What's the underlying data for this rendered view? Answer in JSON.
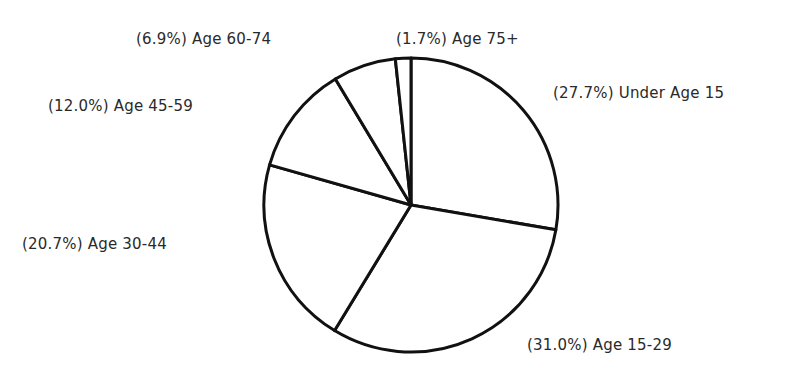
{
  "chart_data": {
    "type": "pie",
    "title": "",
    "start_angle_deg": 0,
    "direction": "clockwise",
    "slices": [
      {
        "label": "Under Age 15",
        "value": 27.7,
        "display": "(27.7%) Under Age 15"
      },
      {
        "label": "Age 15-29",
        "value": 31.0,
        "display": "(31.0%) Age 15-29"
      },
      {
        "label": "Age 30-44",
        "value": 20.7,
        "display": "(20.7%) Age 30-44"
      },
      {
        "label": "Age 45-59",
        "value": 12.0,
        "display": "(12.0%) Age 45-59"
      },
      {
        "label": "Age 60-74",
        "value": 6.9,
        "display": "(6.9%) Age 60-74"
      },
      {
        "label": "Age 75+",
        "value": 1.7,
        "display": "(1.7%) Age 75+"
      }
    ],
    "colors": {
      "fill": "#ffffff",
      "stroke": "#111111"
    },
    "legend": "none (labels placed beside slices)"
  }
}
